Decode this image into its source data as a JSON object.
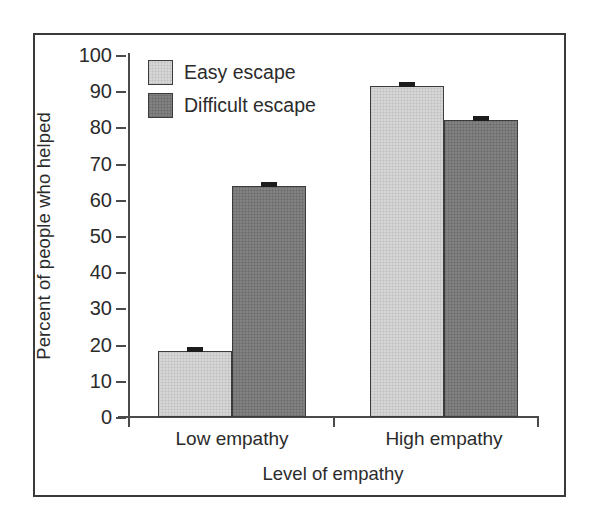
{
  "chart_data": {
    "type": "bar",
    "title": "",
    "xlabel": "Level of empathy",
    "ylabel": "Percent of people who helped",
    "categories": [
      "Low empathy",
      "High empathy"
    ],
    "series": [
      {
        "name": "Easy escape",
        "values": [
          18.2,
          91.5
        ],
        "color": "#d6d6d6"
      },
      {
        "name": "Difficult escape",
        "values": [
          63.8,
          82.0
        ],
        "color": "#828282"
      }
    ],
    "errors": [
      {
        "name": "Easy escape",
        "values": [
          1.0,
          1.0
        ]
      },
      {
        "name": "Difficult escape",
        "values": [
          1.0,
          1.0
        ]
      }
    ],
    "ylim": [
      0,
      100
    ],
    "yticks": [
      0,
      10,
      20,
      30,
      40,
      50,
      60,
      70,
      80,
      90,
      100
    ],
    "ytick_labels": [
      "0",
      "10",
      "20",
      "30",
      "40",
      "50",
      "60",
      "70",
      "80",
      "90",
      "100"
    ],
    "grid": false,
    "legend_position": "top-left",
    "legend_entries": [
      "Easy escape",
      "Difficult escape"
    ]
  },
  "axes": {
    "y_title": "Percent of people who helped",
    "x_title": "Level of empathy"
  },
  "legend": {
    "items": [
      {
        "label": "Easy escape",
        "swatch": "light"
      },
      {
        "label": "Difficult escape",
        "swatch": "dark"
      }
    ]
  },
  "colors": {
    "easy_escape": "#d6d6d6",
    "difficult_escape": "#828282",
    "axis": "#4a4a4a",
    "frame": "#3a3a3a",
    "text": "#2b2b2b"
  }
}
